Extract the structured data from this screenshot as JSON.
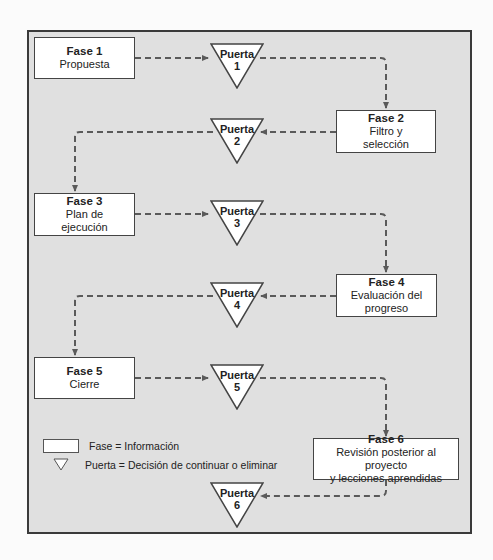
{
  "diagram": {
    "type": "stage-gate flowchart",
    "phases": [
      {
        "title": "Fase 1",
        "label": "Propuesta"
      },
      {
        "title": "Fase 2",
        "label": "Filtro y selección"
      },
      {
        "title": "Fase 3",
        "label": "Plan de ejecución"
      },
      {
        "title": "Fase 4",
        "label": "Evaluación del progreso"
      },
      {
        "title": "Fase 5",
        "label": "Cierre"
      },
      {
        "title": "Fase 6",
        "label": "Revisión posterior al proyecto y lecciones aprendidas"
      }
    ],
    "phase_lines": [
      [
        "Fase 1",
        "Propuesta"
      ],
      [
        "Fase 2",
        "Filtro y",
        "selección"
      ],
      [
        "Fase 3",
        "Plan de",
        "ejecución"
      ],
      [
        "Fase 4",
        "Evaluación del",
        "progreso"
      ],
      [
        "Fase 5",
        "Cierre"
      ],
      [
        "Fase 6",
        "Revisión posterior al proyecto",
        "y lecciones aprendidas"
      ]
    ],
    "gates": [
      {
        "word": "Puerta",
        "number": "1"
      },
      {
        "word": "Puerta",
        "number": "2"
      },
      {
        "word": "Puerta",
        "number": "3"
      },
      {
        "word": "Puerta",
        "number": "4"
      },
      {
        "word": "Puerta",
        "number": "5"
      },
      {
        "word": "Puerta",
        "number": "6"
      }
    ],
    "flow": [
      "Fase 1",
      "Puerta 1",
      "Fase 2",
      "Puerta 2",
      "Fase 3",
      "Puerta 3",
      "Fase 4",
      "Puerta 4",
      "Fase 5",
      "Puerta 5",
      "Fase 6",
      "Puerta 6"
    ],
    "legend": {
      "phase": "Fase = Información",
      "gate": "Puerta = Decisión de continuar o eliminar"
    },
    "colors": {
      "frame_bg": "#e0e0e0",
      "frame_border": "#3a3a3a",
      "box_bg": "#ffffff",
      "arrow": "#5a5a5a"
    }
  }
}
